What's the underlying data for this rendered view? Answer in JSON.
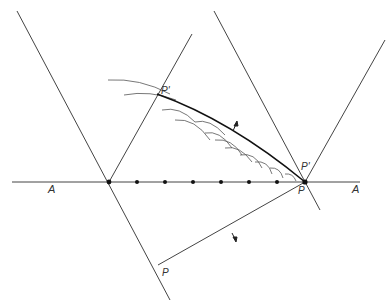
{
  "diagram": {
    "colors": {
      "line": "#444444",
      "envelope": "#111111",
      "arc": "#555555",
      "dot": "#111111",
      "background": "#ffffff"
    },
    "labels": {
      "axis_left": "A",
      "axis_right": "A",
      "p_prime_top": "P'",
      "p_prime_right": "P'",
      "p_right": "P",
      "p_bottom": "P"
    },
    "axis": {
      "y": 182,
      "x_start": 12,
      "x_end": 360,
      "dots_x": [
        109,
        137,
        165,
        193,
        221,
        249,
        277,
        305
      ]
    },
    "lines": [
      {
        "name": "left-outer-line",
        "x1": 17,
        "y1": 11,
        "x2": 170,
        "y2": 300
      },
      {
        "name": "left-inner-line",
        "x1": 192,
        "y1": 34,
        "x2": 109,
        "y2": 182
      },
      {
        "name": "right-inner-line",
        "x1": 214,
        "y1": 11,
        "x2": 320,
        "y2": 210
      },
      {
        "name": "right-outer-line",
        "x1": 385,
        "y1": 40,
        "x2": 305,
        "y2": 182
      },
      {
        "name": "lower-slant-line",
        "x1": 305,
        "y1": 182,
        "x2": 158,
        "y2": 265
      }
    ]
  }
}
